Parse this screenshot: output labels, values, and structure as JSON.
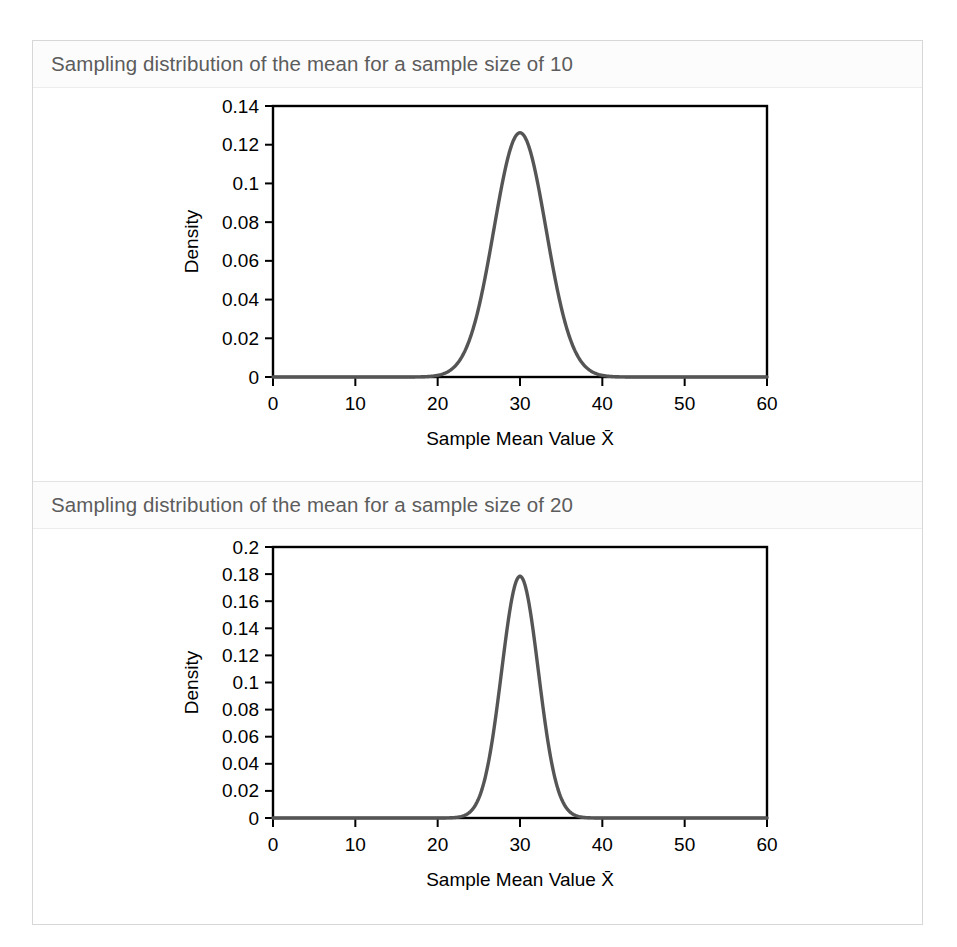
{
  "figure": {
    "background": "#ffffff",
    "card_border": "#d7d7d7",
    "title_color": "#5c5c5c",
    "curve_color": "#555555",
    "axis_color": "#000000"
  },
  "panels": [
    {
      "title": "Sampling distribution of the mean for a sample size of 10",
      "chart_index": 0
    },
    {
      "title": "Sampling distribution of the mean for a sample size of 20",
      "chart_index": 1
    }
  ],
  "chart_data": [
    {
      "type": "line",
      "title": "Sampling distribution of the mean for a sample size of 10",
      "xlabel": "Sample Mean Value X̄",
      "ylabel": "Density",
      "xlim": [
        0,
        60
      ],
      "ylim": [
        0,
        0.14
      ],
      "xticks": [
        0,
        10,
        20,
        30,
        40,
        50,
        60
      ],
      "xtick_labels": [
        "0",
        "10",
        "20",
        "30",
        "40",
        "50",
        "60"
      ],
      "yticks": [
        0,
        0.02,
        0.04,
        0.06,
        0.08,
        0.1,
        0.12,
        0.14
      ],
      "ytick_labels": [
        "0",
        "0.02",
        "0.04",
        "0.06",
        "0.08",
        "0.1",
        "0.12",
        "0.14"
      ],
      "grid": false,
      "legend": null,
      "distribution": {
        "family": "normal",
        "mean": 30,
        "sd": 3.162,
        "peak_density": 0.1262,
        "sample_size": 10,
        "population_sd": 10
      },
      "x": [
        0,
        2,
        4,
        6,
        8,
        10,
        12,
        14,
        16,
        18,
        19,
        20,
        21,
        22,
        23,
        24,
        25,
        26,
        27,
        28,
        29,
        30,
        31,
        32,
        33,
        34,
        35,
        36,
        37,
        38,
        39,
        40,
        41,
        42,
        44,
        46,
        48,
        50,
        52,
        54,
        56,
        58,
        60
      ],
      "y": [
        0,
        0,
        0,
        0,
        0,
        0,
        0,
        1e-05,
        7e-05,
        0.00047,
        0.00101,
        0.00203,
        0.00387,
        0.00696,
        0.01184,
        0.01904,
        0.02897,
        0.04166,
        0.05666,
        0.07291,
        0.08879,
        0.10249,
        0.11246,
        0.11779,
        0.11838,
        0.11493,
        0.10861,
        0.10061,
        0.09179,
        0.08258,
        0.07322,
        0.06392,
        0.05496,
        0.04666,
        0.03247,
        0.0214,
        0.01331,
        0.00779,
        0.00429,
        0.00222,
        0.00108,
        0.00049,
        0.00021
      ]
    },
    {
      "type": "line",
      "title": "Sampling distribution of the mean for a sample size of 20",
      "xlabel": "Sample Mean Value X̄",
      "ylabel": "Density",
      "xlim": [
        0,
        60
      ],
      "ylim": [
        0,
        0.2
      ],
      "xticks": [
        0,
        10,
        20,
        30,
        40,
        50,
        60
      ],
      "xtick_labels": [
        "0",
        "10",
        "20",
        "30",
        "40",
        "50",
        "60"
      ],
      "yticks": [
        0,
        0.02,
        0.04,
        0.06,
        0.08,
        0.1,
        0.12,
        0.14,
        0.16,
        0.18,
        0.2
      ],
      "ytick_labels": [
        "0",
        "0.02",
        "0.04",
        "0.06",
        "0.08",
        "0.1",
        "0.12",
        "0.14",
        "0.16",
        "0.18",
        "0.2"
      ],
      "grid": false,
      "legend": null,
      "distribution": {
        "family": "normal",
        "mean": 30,
        "sd": 2.236,
        "peak_density": 0.1784,
        "sample_size": 20,
        "population_sd": 10
      },
      "x": [
        0,
        4,
        8,
        12,
        16,
        20,
        21,
        22,
        23,
        24,
        25,
        26,
        27,
        28,
        29,
        30,
        31,
        32,
        33,
        34,
        35,
        36,
        37,
        38,
        39,
        40,
        44,
        48,
        52,
        56,
        60
      ],
      "y": [
        0,
        0,
        0,
        0,
        0,
        3e-05,
        0.00013,
        0.00049,
        0.00159,
        0.00449,
        0.01106,
        0.02371,
        0.04427,
        0.07195,
        0.1018,
        0.12533,
        0.13426,
        0.12533,
        0.1018,
        0.07195,
        0.04427,
        0.02371,
        0.01106,
        0.00449,
        0.00159,
        0.00049,
        0,
        0,
        0,
        0,
        0
      ]
    }
  ]
}
